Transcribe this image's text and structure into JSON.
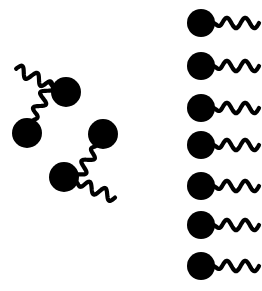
{
  "figure": {
    "title": "Surfactant micelle and free monomers diagram",
    "background_color": "#ffffff",
    "ink_color": "#000000",
    "width": 262,
    "height": 291,
    "style": {
      "head_shape": "filled-circle",
      "tail_shape": "wavy-line",
      "tail_stroke_width": 4.2,
      "tail_wave_count": 2.5
    }
  },
  "groups": [
    {
      "id": "micelle-cluster",
      "name": "micelle",
      "label": "Micelle (aggregated surfactant molecules)",
      "arrangement": "diamond-ring",
      "molecule_count": 4,
      "center": {
        "x": 65,
        "y": 134
      },
      "molecules": [
        {
          "id": "micelle-molecule-top",
          "position": "top",
          "head": {
            "cx": 66,
            "cy": 92,
            "r": 15
          },
          "tail_angle_deg": 205,
          "tail_length": 42
        },
        {
          "id": "micelle-molecule-left",
          "position": "left",
          "head": {
            "cx": 27,
            "cy": 133,
            "r": 15
          },
          "tail_angle_deg": 295,
          "tail_length": 42
        },
        {
          "id": "micelle-molecule-bottom",
          "position": "bottom",
          "head": {
            "cx": 64,
            "cy": 177,
            "r": 15
          },
          "tail_angle_deg": 22,
          "tail_length": 42
        },
        {
          "id": "micelle-molecule-right",
          "position": "right",
          "head": {
            "cx": 103,
            "cy": 134,
            "r": 15
          },
          "tail_angle_deg": 120,
          "tail_length": 42
        }
      ]
    },
    {
      "id": "free-monomer-column",
      "name": "free-monomers",
      "label": "Free surfactant monomers",
      "arrangement": "vertical-column",
      "molecule_count": 7,
      "molecules": [
        {
          "id": "free-monomer-1",
          "head": {
            "cx": 201,
            "cy": 23,
            "r": 14
          },
          "tail_angle_deg": 0,
          "tail_length": 46
        },
        {
          "id": "free-monomer-2",
          "head": {
            "cx": 201,
            "cy": 66,
            "r": 14
          },
          "tail_angle_deg": 0,
          "tail_length": 46
        },
        {
          "id": "free-monomer-3",
          "head": {
            "cx": 201,
            "cy": 108,
            "r": 14
          },
          "tail_angle_deg": 0,
          "tail_length": 46
        },
        {
          "id": "free-monomer-4",
          "head": {
            "cx": 201,
            "cy": 145,
            "r": 14
          },
          "tail_angle_deg": 0,
          "tail_length": 46
        },
        {
          "id": "free-monomer-5",
          "head": {
            "cx": 201,
            "cy": 186,
            "r": 14
          },
          "tail_angle_deg": 0,
          "tail_length": 46
        },
        {
          "id": "free-monomer-6",
          "head": {
            "cx": 201,
            "cy": 225,
            "r": 14
          },
          "tail_angle_deg": 0,
          "tail_length": 46
        },
        {
          "id": "free-monomer-7",
          "head": {
            "cx": 201,
            "cy": 266,
            "r": 14
          },
          "tail_angle_deg": 0,
          "tail_length": 46
        }
      ]
    }
  ]
}
